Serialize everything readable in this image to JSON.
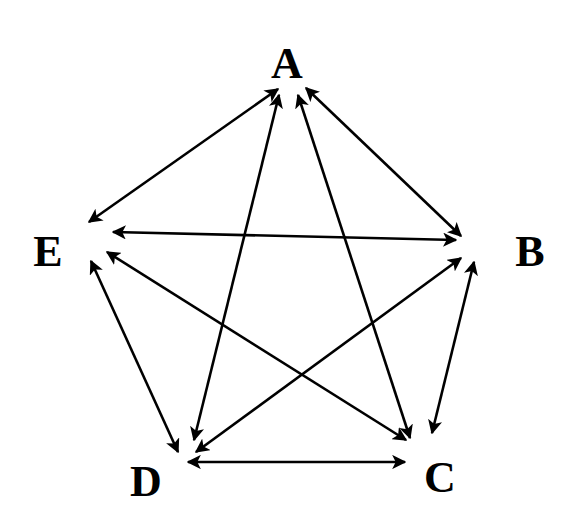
{
  "diagram": {
    "type": "complete-graph",
    "colors": {
      "background": "#ffffff",
      "stroke": "#000000",
      "text": "#000000"
    },
    "nodes": [
      {
        "id": "A",
        "label": "A",
        "x": 287,
        "y": 64
      },
      {
        "id": "B",
        "label": "B",
        "x": 530,
        "y": 252
      },
      {
        "id": "C",
        "label": "C",
        "x": 440,
        "y": 478
      },
      {
        "id": "D",
        "label": "D",
        "x": 146,
        "y": 482
      },
      {
        "id": "E",
        "label": "E",
        "x": 48,
        "y": 252
      }
    ],
    "edges": [
      {
        "from": "A",
        "to": "E",
        "x1": 278,
        "y1": 89,
        "x2": 89,
        "y2": 222,
        "direction": "bidirectional"
      },
      {
        "from": "A",
        "to": "B",
        "x1": 306,
        "y1": 88,
        "x2": 461,
        "y2": 236,
        "direction": "bidirectional"
      },
      {
        "from": "A",
        "to": "D",
        "x1": 279,
        "y1": 95,
        "x2": 194,
        "y2": 440,
        "direction": "bidirectional"
      },
      {
        "from": "A",
        "to": "C",
        "x1": 298,
        "y1": 95,
        "x2": 410,
        "y2": 438,
        "direction": "bidirectional"
      },
      {
        "from": "E",
        "to": "B",
        "x1": 113,
        "y1": 232,
        "x2": 456,
        "y2": 240,
        "direction": "bidirectional"
      },
      {
        "from": "E",
        "to": "C",
        "x1": 107,
        "y1": 252,
        "x2": 406,
        "y2": 440,
        "direction": "bidirectional"
      },
      {
        "from": "E",
        "to": "D",
        "x1": 91,
        "y1": 261,
        "x2": 178,
        "y2": 452,
        "direction": "bidirectional"
      },
      {
        "from": "B",
        "to": "D",
        "x1": 461,
        "y1": 258,
        "x2": 196,
        "y2": 452,
        "direction": "bidirectional"
      },
      {
        "from": "B",
        "to": "C",
        "x1": 474,
        "y1": 262,
        "x2": 432,
        "y2": 433,
        "direction": "bidirectional"
      },
      {
        "from": "D",
        "to": "C",
        "x1": 188,
        "y1": 462,
        "x2": 405,
        "y2": 462,
        "direction": "bidirectional"
      }
    ]
  }
}
